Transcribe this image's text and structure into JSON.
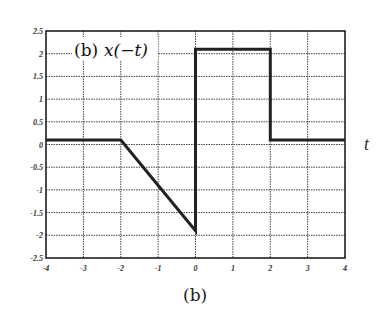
{
  "chart_data": {
    "type": "line",
    "title": "(b) x(−t)",
    "title_prefix": "(b)",
    "title_func": "x(−t)",
    "xlabel": "t",
    "ylabel": "",
    "caption": "(b)",
    "xlim": [
      -4,
      4
    ],
    "ylim": [
      -2.5,
      2.5
    ],
    "grid": true,
    "grid_style": "dotted",
    "legend": null,
    "x_ticks": [
      -4,
      -3,
      -2,
      -1,
      0,
      1,
      2,
      3,
      4
    ],
    "y_ticks": [
      2.5,
      2,
      1.5,
      1,
      0.5,
      0,
      -0.5,
      -1,
      -1.5,
      -2,
      -2.5
    ],
    "x_tick_labels": [
      "-4",
      "-3",
      "-2",
      "-1",
      "0",
      "1",
      "2",
      "3",
      "4"
    ],
    "y_tick_labels": [
      "2.5",
      "2",
      "1.5",
      "1",
      "0.5",
      "0",
      "-0.5",
      "-1",
      "-1.5",
      "-2",
      "-2.5"
    ],
    "series": [
      {
        "name": "x(-t)",
        "color": "#222222",
        "x": [
          -4,
          -2,
          0,
          0,
          2,
          2,
          4
        ],
        "y": [
          0.1,
          0.1,
          -1.9,
          2.1,
          2.1,
          0.1,
          0.1
        ]
      }
    ]
  },
  "labels": {
    "caption": "(b)",
    "xvar": "t",
    "title_prefix": "(b)",
    "title_func": "x(−t)"
  }
}
